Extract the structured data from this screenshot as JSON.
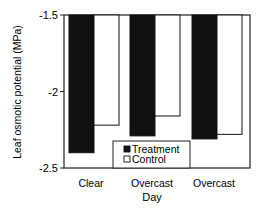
{
  "chart_data": {
    "type": "bar",
    "title": "",
    "xlabel": "Day",
    "ylabel": "Leaf osmotic potential (MPa)",
    "categories": [
      "Clear",
      "Overcast",
      "Overcast"
    ],
    "series": [
      {
        "name": "Treatment",
        "color": "#111111",
        "values": [
          -2.4,
          -2.29,
          -2.31
        ]
      },
      {
        "name": "Control",
        "color": "#ffffff",
        "values": [
          -2.22,
          -2.16,
          -2.28
        ]
      }
    ],
    "ylim": [
      -2.5,
      -1.5
    ],
    "yticks": [
      "-1.5",
      "-2",
      "-2.5"
    ],
    "grid": false,
    "legend_position": "bottom-center inside plot",
    "bar_baseline": -1.5
  },
  "legend": {
    "items": [
      "Treatment",
      "Control"
    ]
  },
  "axes": {
    "xlabel": "Day",
    "ylabel": "Leaf osmotic potential (MPa)"
  }
}
